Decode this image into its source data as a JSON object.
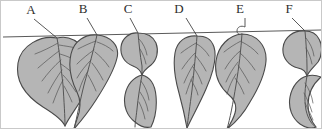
{
  "figure": {
    "name": "leaf-morphology-diagram",
    "background_color": "#ffffff",
    "border_color": "#c9c9c9",
    "leaf_fill_color": "#b5b5b5",
    "leaf_outline_color": "#4a4a4a",
    "vein_color": "#555555",
    "branch_color": "#5a5a5a",
    "label_color": "#2e2e2e"
  },
  "branch": {
    "name": "branch-line",
    "start": [
      2,
      36
    ],
    "end": [
      320,
      29
    ]
  },
  "leaves": [
    {
      "label": "A",
      "label_x": 30,
      "label_y": 13,
      "leader_line": [
        [
          33,
          18
        ],
        [
          56,
          37
        ]
      ],
      "shape": "broad-ovate",
      "outline": "M 56 37 C 40 34, 20 44, 17 62 C 14 80, 25 95, 42 106 C 55 114, 62 120, 64 125 C 68 116, 78 104, 84 92 C 92 76, 90 58, 82 47 C 74 37, 64 35, 56 37 Z",
      "midrib": "M 56 37 C 58 48, 60 66, 62 84 C 63 100, 64 116, 64 125",
      "veins": [
        "M 57 42 C 50 46, 42 50, 34 53",
        "M 58 50 C 51 55, 44 61, 37 67",
        "M 60 59 C 53 65, 47 72, 41 80",
        "M 61 69 C 56 76, 51 84, 47 92",
        "M 62 79 C 58 86, 55 94, 52 102",
        "M 58 44 C 64 45, 72 46, 79 48",
        "M 59 53 C 66 55, 73 58, 80 62",
        "M 60 63 C 66 67, 72 72, 78 78",
        "M 62 74 C 67 79, 71 85, 75 91",
        "M 63 85 C 66 90, 69 96, 71 101"
      ]
    },
    {
      "label": "B",
      "label_x": 82,
      "label_y": 12,
      "leader_line": [
        [
          86,
          17
        ],
        [
          96,
          34
        ]
      ],
      "shape": "ovate-acuminate-twisted-tail",
      "outline": "M 96 34 C 84 33, 73 40, 70 53 C 67 66, 70 79, 76 91 C 80 99, 80 108, 76 118 C 74 124, 73 127, 73 128 C 80 120, 88 110, 95 99 C 104 85, 113 70, 116 57 C 119 45, 110 35, 96 34 Z",
      "midrib": "M 96 34 C 93 47, 88 66, 83 84 C 79 100, 76 116, 73 128",
      "veins": [
        "M 95 40 C 89 42, 83 45, 77 48",
        "M 93 49 C 87 53, 81 58, 76 63",
        "M 90 59 C 85 64, 80 70, 76 77",
        "M 87 70 C 83 76, 80 83, 78 90",
        "M 96 41 C 102 43, 108 46, 112 50",
        "M 94 51 C 99 55, 104 60, 108 66",
        "M 91 62 C 95 67, 99 73, 102 79",
        "M 87 74 C 90 79, 93 85, 95 90"
      ]
    },
    {
      "label": "C",
      "label_x": 127,
      "label_y": 12,
      "leader_line": [
        [
          129,
          17
        ],
        [
          137,
          32
        ]
      ],
      "shape": "constricted-waisted-two-lobed",
      "outline": "M 137 32 C 129 31, 121 37, 120 46 C 119 55, 124 62, 132 65 C 137 67, 140 70, 141 74 C 142 70, 146 67, 150 64 C 156 59, 158 50, 155 42 C 152 35, 145 32, 137 32 Z",
      "outline2": "M 141 74 C 133 76, 126 83, 124 94 C 122 105, 126 115, 134 121 C 140 126, 146 127, 150 126 C 154 118, 156 106, 155 95 C 154 84, 149 76, 141 74 Z",
      "midrib": "M 137 32 C 138 42, 139 54, 141 65 C 141 70, 141 72, 141 74",
      "midrib2": "M 141 74 C 139 85, 137 97, 136 108 C 135 117, 134 123, 134 126",
      "veins": [
        "M 138 38 C 142 42, 145 48, 146 54",
        "M 139 48 C 142 53, 144 58, 145 63",
        "M 140 80 C 144 85, 147 92, 148 99",
        "M 139 91 C 143 97, 146 103, 147 110",
        "M 138 101 C 141 107, 143 113, 144 118"
      ]
    },
    {
      "label": "D",
      "label_x": 178,
      "label_y": 12,
      "leader_line": [
        [
          185,
          17
        ],
        [
          196,
          35
        ]
      ],
      "shape": "elongate-lanceolate",
      "outline": "M 196 35 C 185 34, 176 40, 174 52 C 172 64, 174 78, 178 92 C 181 103, 184 116, 186 127 C 191 116, 199 102, 205 88 C 212 72, 216 56, 213 46 C 210 37, 204 35, 196 35 Z",
      "midrib": "M 196 35 C 195 50, 193 70, 191 89 C 189 105, 187 118, 186 127",
      "veins": [
        "M 195 42 C 190 45, 185 48, 180 52",
        "M 194 52 C 189 57, 185 62, 181 68",
        "M 193 63 C 189 69, 186 75, 183 82",
        "M 192 75 C 189 81, 187 87, 185 93",
        "M 196 43 C 201 46, 205 50, 208 55",
        "M 194 54 C 198 59, 202 64, 205 70",
        "M 192 66 C 196 71, 199 77, 201 83",
        "M 190 79 C 193 84, 196 89, 197 94"
      ]
    },
    {
      "label": "E",
      "label_x": 239,
      "label_y": 12,
      "leader_line": [
        [
          244,
          17
        ],
        [
          244,
          26
        ]
      ],
      "petiole": "M 244 26 C 240 24, 236 26, 236 30 C 236 33, 239 34, 241 33",
      "shape": "obovate-with-twisting-tail",
      "outline": "M 241 33 C 228 34, 217 45, 215 60 C 213 74, 219 86, 228 94 C 234 99, 236 105, 234 112 C 232 119, 228 125, 226 128 C 234 122, 243 112, 249 101 C 257 88, 264 73, 265 60 C 266 44, 255 33, 241 33 Z",
      "midrib": "M 241 33 C 240 48, 238 66, 235 84 C 232 102, 229 118, 226 128",
      "veins": [
        "M 240 40 C 234 43, 228 47, 223 51",
        "M 239 50 C 233 55, 228 61, 224 68",
        "M 237 61 C 232 67, 228 74, 225 81",
        "M 235 73 C 231 79, 228 86, 226 93",
        "M 241 41 C 247 44, 253 48, 257 53",
        "M 239 52 C 245 57, 250 63, 254 69",
        "M 237 64 C 241 70, 245 76, 248 82",
        "M 234 77 C 238 82, 241 88, 243 93"
      ]
    },
    {
      "label": "F",
      "label_x": 288,
      "label_y": 12,
      "leader_line": [
        [
          291,
          17
        ],
        [
          304,
          30
        ]
      ],
      "shape": "rounded-lobe-with-falcate-tail",
      "outline": "M 304 30 C 293 29, 283 36, 282 47 C 281 57, 288 65, 297 67 C 302 68, 305 71, 306 75 C 308 70, 313 66, 317 61 C 321 55, 322 45, 318 38 C 315 32, 310 30, 304 30 Z",
      "outline2": "M 306 75 C 298 77, 291 85, 289 96 C 287 107, 291 117, 299 123 C 305 127, 311 128, 315 126 C 311 121, 307 113, 307 104 C 307 93, 312 83, 320 76 C 315 74, 310 74, 306 75 Z",
      "midrib": "M 304 30 C 305 41, 306 55, 306 66 C 306 71, 306 74, 306 75",
      "midrib2": "M 306 75 C 304 86, 303 98, 305 109 C 307 118, 311 124, 315 126",
      "veins": [
        "M 305 37 C 309 42, 312 48, 313 55",
        "M 305 47 C 308 52, 310 58, 311 63",
        "M 304 82 C 308 88, 311 95, 312 102",
        "M 303 92 C 306 98, 309 104, 311 111",
        "M 304 102 C 307 108, 310 114, 312 119"
      ]
    }
  ]
}
